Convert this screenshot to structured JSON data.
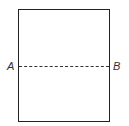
{
  "diagram": {
    "shape": "rectangle",
    "fold_line": {
      "style": "dashed",
      "orientation": "horizontal"
    },
    "labels": {
      "left": "A",
      "right": "B"
    }
  }
}
